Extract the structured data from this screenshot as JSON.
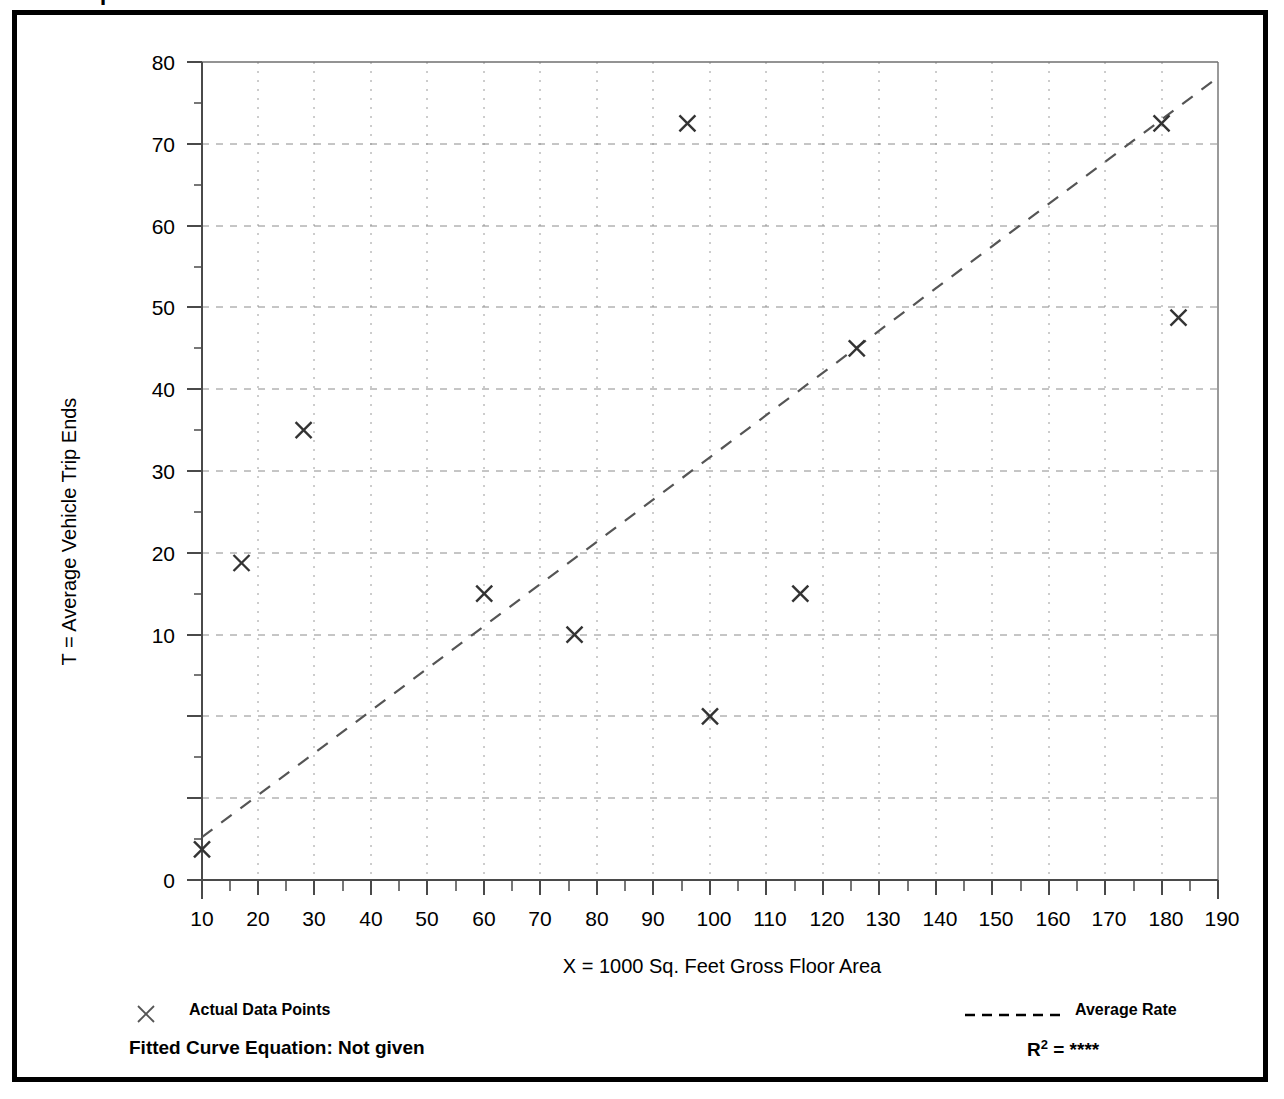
{
  "top_fragment": "I",
  "axes": {
    "x_title": "X = 1000 Sq. Feet Gross Floor Area",
    "y_title": "T = Average Vehicle Trip Ends",
    "x_ticks": [
      "10",
      "20",
      "30",
      "40",
      "50",
      "60",
      "70",
      "80",
      "90",
      "100",
      "110",
      "120",
      "130",
      "140",
      "150",
      "160",
      "170",
      "180",
      "190"
    ],
    "y_ticks": [
      "0",
      "10",
      "20",
      "30",
      "40",
      "50",
      "60",
      "70",
      "80"
    ]
  },
  "legend": {
    "data_points_label": "Actual Data Points",
    "data_points_marker": "x-marker-icon",
    "average_rate_label": "Average Rate",
    "average_rate_marker": "dashed-line-icon"
  },
  "footer": {
    "equation_label": "Fitted Curve Equation:  Not given",
    "r2_prefix": "R",
    "r2_exponent": "2",
    "r2_value": " = ****"
  },
  "colors": {
    "frame": "#000000",
    "axis": "#555555",
    "grid": "#888888",
    "marker": "#333333",
    "trend": "#555555"
  },
  "chart_data": {
    "type": "scatter",
    "title": "",
    "xlabel": "X = 1000 Sq. Feet Gross Floor Area",
    "ylabel": "T = Average Vehicle Trip Ends",
    "xlim": [
      10,
      190
    ],
    "ylim": [
      0,
      80
    ],
    "x_major_step": 10,
    "x_minor_step": 5,
    "y_major_step": 10,
    "y_minor_step": 5,
    "grid": true,
    "legend_position": "below-plot",
    "series": [
      {
        "name": "Actual Data Points",
        "marker": "x",
        "points": [
          {
            "x": 10,
            "y": 3
          },
          {
            "x": 17,
            "y": 31
          },
          {
            "x": 28,
            "y": 44
          },
          {
            "x": 60,
            "y": 28
          },
          {
            "x": 76,
            "y": 24
          },
          {
            "x": 96,
            "y": 74
          },
          {
            "x": 100,
            "y": 16
          },
          {
            "x": 116,
            "y": 28
          },
          {
            "x": 126,
            "y": 52
          },
          {
            "x": 180,
            "y": 74
          },
          {
            "x": 183,
            "y": 55
          }
        ]
      },
      {
        "name": "Average Rate",
        "style": "dashed-line",
        "points": [
          {
            "x": 10,
            "y": 4.2
          },
          {
            "x": 190,
            "y": 78.5
          }
        ]
      }
    ],
    "annotations": {
      "fitted_curve_equation": "Not given",
      "r_squared": "****"
    }
  }
}
